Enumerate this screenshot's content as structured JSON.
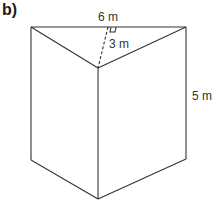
{
  "part_label": "b)",
  "figure": {
    "type": "triangular prism",
    "labels": {
      "top_edge": "6 m",
      "height_of_triangle": "3 m",
      "prism_height": "5 m"
    },
    "line_color": "#333333"
  }
}
